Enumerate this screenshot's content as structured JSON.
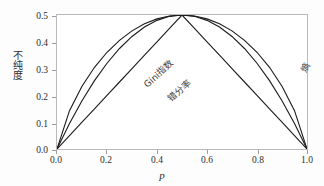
{
  "chart_data": {
    "type": "line",
    "title": "",
    "xlabel": "p",
    "ylabel": "不纯度",
    "xlim": [
      0.0,
      1.0
    ],
    "ylim": [
      0.0,
      0.5
    ],
    "grid": false,
    "legend_position": "inline-annotations",
    "xticks": [
      "0.0",
      "0.2",
      "0.4",
      "0.6",
      "0.8",
      "1.0"
    ],
    "xtick_values": [
      0.0,
      0.2,
      0.4,
      0.6,
      0.8,
      1.0
    ],
    "yticks": [
      "0.0",
      "0.1",
      "0.2",
      "0.3",
      "0.4",
      "0.5"
    ],
    "ytick_values": [
      0.0,
      0.1,
      0.2,
      0.3,
      0.4,
      0.5
    ],
    "x": [
      0.0,
      0.05,
      0.1,
      0.15,
      0.2,
      0.25,
      0.3,
      0.35,
      0.4,
      0.45,
      0.5,
      0.55,
      0.6,
      0.65,
      0.7,
      0.75,
      0.8,
      0.85,
      0.9,
      0.95,
      1.0
    ],
    "series": [
      {
        "name": "熵",
        "label": "熵",
        "color": "#1a1a1a",
        "description": "Scaled entropy: -(p*log2(p) + (1-p)*log2(1-p)) / 2",
        "values": [
          0.0,
          0.1431,
          0.2345,
          0.3049,
          0.361,
          0.4056,
          0.4408,
          0.4671,
          0.4855,
          0.4963,
          0.5,
          0.4963,
          0.4855,
          0.4671,
          0.4408,
          0.4056,
          0.361,
          0.3049,
          0.2345,
          0.1431,
          0.0
        ]
      },
      {
        "name": "Gini指数",
        "label": "Gini指数",
        "color": "#1a1a1a",
        "description": "Gini index: 2*p*(1-p)",
        "values": [
          0.0,
          0.095,
          0.18,
          0.255,
          0.32,
          0.375,
          0.42,
          0.455,
          0.48,
          0.495,
          0.5,
          0.495,
          0.48,
          0.455,
          0.42,
          0.375,
          0.32,
          0.255,
          0.18,
          0.095,
          0.0
        ]
      },
      {
        "name": "错分率",
        "label": "错分率",
        "color": "#1a1a1a",
        "description": "Misclassification rate: min(p, 1-p)",
        "values": [
          0.0,
          0.05,
          0.1,
          0.15,
          0.2,
          0.25,
          0.3,
          0.35,
          0.4,
          0.45,
          0.5,
          0.45,
          0.4,
          0.35,
          0.3,
          0.25,
          0.2,
          0.15,
          0.1,
          0.05,
          0.0
        ]
      }
    ],
    "annotations": [
      {
        "text": "Gini指数",
        "at_x": 0.18,
        "at_y": 0.33
      },
      {
        "text": "错分率",
        "at_x": 0.27,
        "at_y": 0.27
      },
      {
        "text": "熵",
        "at_x": 0.8,
        "at_y": 0.37
      }
    ]
  },
  "axis": {
    "x_title": "p",
    "y_title": "不纯度"
  },
  "colors": {
    "frame": "#b9b9b9",
    "curve": "#1a1a1a",
    "tick_text": "#2c2c2c",
    "background": "#fdfdfd",
    "plot_background": "#ffffff"
  }
}
